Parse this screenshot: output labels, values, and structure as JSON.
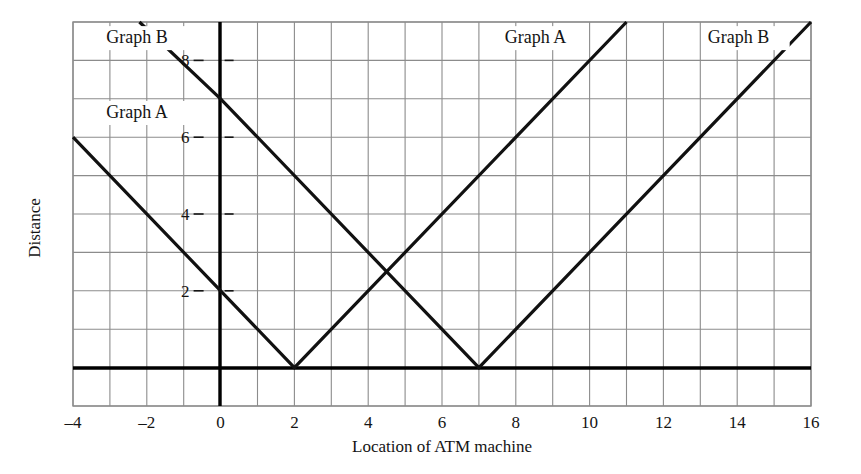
{
  "chart_data": {
    "type": "line",
    "title": "",
    "xlabel": "Location of ATM machine",
    "ylabel": "Distance",
    "xlim": [
      -4,
      16
    ],
    "ylim": [
      -1,
      9
    ],
    "grid": true,
    "grid_step_x": 1,
    "grid_step_y": 1,
    "xticks": [
      -4,
      -2,
      0,
      2,
      4,
      6,
      8,
      10,
      12,
      14,
      16
    ],
    "xtick_labels": [
      "–4",
      "–2",
      "0",
      "2",
      "4",
      "6",
      "8",
      "10",
      "12",
      "14",
      "16"
    ],
    "yticks": [
      2,
      4,
      6,
      8
    ],
    "ytick_labels": [
      "2",
      "4",
      "6",
      "8"
    ],
    "legend_position": "inline-annotations",
    "series": [
      {
        "name": "Graph A",
        "shape": "absolute-value V",
        "vertex": [
          2,
          0
        ],
        "slope": 1,
        "points": [
          [
            -4,
            6
          ],
          [
            2,
            0
          ],
          [
            11,
            9
          ]
        ]
      },
      {
        "name": "Graph B",
        "shape": "absolute-value V",
        "vertex": [
          7,
          0
        ],
        "slope": 1,
        "points": [
          [
            -2.2,
            9
          ],
          [
            0,
            7
          ],
          [
            7,
            0
          ],
          [
            16,
            9
          ]
        ]
      }
    ],
    "annotations": [
      {
        "text": "Graph B",
        "x": -3.1,
        "y": 8.45
      },
      {
        "text": "Graph A",
        "x": -3.1,
        "y": 6.5
      },
      {
        "text": "Graph A",
        "x": 7.7,
        "y": 8.45
      },
      {
        "text": "Graph B",
        "x": 13.2,
        "y": 8.45
      }
    ]
  },
  "colors": {
    "grid": "#8c8c8c",
    "axis": "#000000",
    "series": "#111111",
    "background": "#ffffff",
    "text": "#141414"
  }
}
